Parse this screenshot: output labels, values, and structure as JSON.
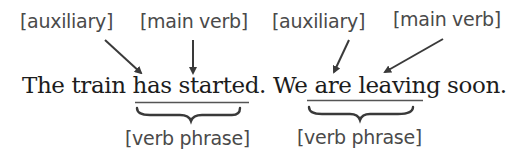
{
  "diagram": {
    "top_labels": [
      {
        "text": "[auxiliary]",
        "role": "auxiliary"
      },
      {
        "text": "[main verb]",
        "role": "main-verb"
      },
      {
        "text": "[auxiliary]",
        "role": "auxiliary"
      },
      {
        "text": "[main verb]",
        "role": "main-verb"
      }
    ],
    "sentence": {
      "part1": "The train ",
      "vp1": "has started",
      "part2": ". We ",
      "vp2": "are leaving",
      "part3": " soon."
    },
    "bottom_labels": [
      {
        "text": "[verb phrase]"
      },
      {
        "text": "[verb phrase]"
      }
    ],
    "colors": {
      "label_text": "#4a4a4a",
      "sentence_text": "#1c1c1c",
      "arrow": "#3a3a3a"
    }
  }
}
